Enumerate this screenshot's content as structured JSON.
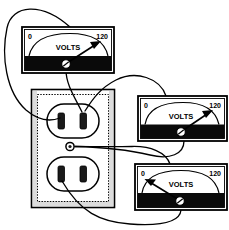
{
  "outlet": {
    "name": "duplex-wall-receptacle",
    "faceplate_color": "#ffffff",
    "outline_color": "#000000",
    "center_screw": {
      "name": "faceplate-center-screw",
      "label": ""
    },
    "receptacles": [
      {
        "name": "upper-receptacle",
        "slots": [
          "neutral-slot-wide",
          "hot-slot-narrow"
        ]
      },
      {
        "name": "lower-receptacle",
        "slots": [
          "neutral-slot-wide",
          "hot-slot-narrow"
        ]
      }
    ]
  },
  "meters": [
    {
      "id": "meter-top",
      "name": "voltmeter-hot-to-neutral",
      "scale_min": "0",
      "scale_max": "120",
      "unit_label": "VOLTS",
      "needle_position": "full-scale",
      "reading": "120",
      "bezel_color": "#000000",
      "face_color": "#ffffff",
      "position": {
        "x": 22,
        "y": 27,
        "w": 92,
        "h": 46
      },
      "face_height": 30,
      "band_height": 16,
      "test_points": [
        "upper-receptacle-hot-slot",
        "upper-receptacle-neutral-slot"
      ]
    },
    {
      "id": "meter-middle",
      "name": "voltmeter-hot-to-ground",
      "scale_min": "0",
      "scale_max": "120",
      "unit_label": "VOLTS",
      "needle_position": "full-scale",
      "reading": "120",
      "bezel_color": "#000000",
      "face_color": "#ffffff",
      "position": {
        "x": 138,
        "y": 96,
        "w": 89,
        "h": 45
      },
      "face_height": 29,
      "band_height": 16,
      "test_points": [
        "upper-receptacle-hot-slot",
        "faceplate-center-screw"
      ]
    },
    {
      "id": "meter-bottom",
      "name": "voltmeter-neutral-to-ground",
      "scale_min": "0",
      "scale_max": "120",
      "unit_label": "VOLTS",
      "needle_position": "zero",
      "reading": "0",
      "bezel_color": "#000000",
      "face_color": "#ffffff",
      "position": {
        "x": 135,
        "y": 164,
        "w": 92,
        "h": 46
      },
      "face_height": 30,
      "band_height": 16,
      "test_points": [
        "faceplate-center-screw",
        "lower-receptacle-neutral-slot"
      ]
    }
  ],
  "leads": [
    {
      "name": "lead-top-meter-left-probe",
      "from": "meter-top-top-left",
      "to": "upper-receptacle-neutral-slot"
    },
    {
      "name": "lead-top-meter-screw-probe",
      "from": "meter-top-screw",
      "to": "upper-receptacle-hot-slot"
    },
    {
      "name": "lead-middle-meter-top-probe",
      "from": "meter-middle-top",
      "to": "upper-receptacle-hot-slot"
    },
    {
      "name": "lead-middle-meter-screw-probe",
      "from": "meter-middle-screw",
      "to": "faceplate-center-screw"
    },
    {
      "name": "lead-bottom-meter-screw-probe",
      "from": "meter-bottom-screw",
      "to": "lower-receptacle-neutral-slot"
    },
    {
      "name": "lead-bottom-meter-top-probe",
      "from": "meter-bottom-top",
      "to": "faceplate-center-screw"
    }
  ],
  "colors": {
    "ink": "#000000",
    "paper": "#ffffff",
    "band": "#0a0a0a",
    "plate_edge": "#d8d8d8"
  }
}
